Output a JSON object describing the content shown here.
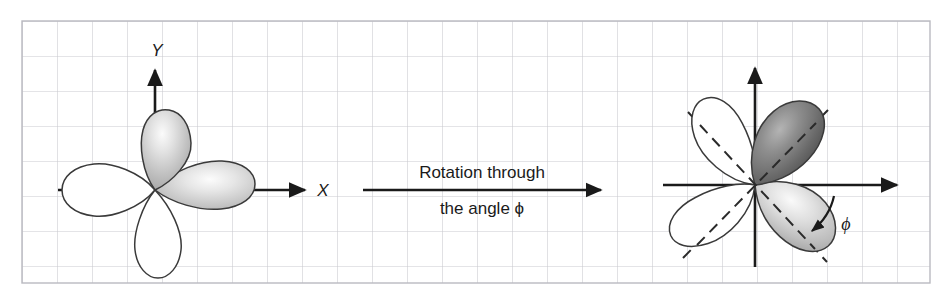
{
  "figure": {
    "background_color": "#ffffff",
    "grid": {
      "visible": true,
      "line_color": "#c9c9cf",
      "border_color": "#b9b9c0",
      "cell_size_px": 35,
      "x_start": 22,
      "y_start": 21,
      "x_end": 930,
      "y_end": 283
    },
    "axis_color": "#1a1a1a",
    "orbital_outline_color": "#3a3a3a"
  },
  "left_diagram": {
    "name": "unrotated-d-orbital",
    "center": {
      "x": 155,
      "y": 190
    },
    "x_axis_label": "X",
    "y_axis_label": "Y",
    "lobes": [
      {
        "name": "lobe-top",
        "angle_deg": 90,
        "fill": "shaded"
      },
      {
        "name": "lobe-right",
        "angle_deg": 0,
        "fill": "shaded"
      },
      {
        "name": "lobe-left",
        "angle_deg": 180,
        "fill": "white"
      },
      {
        "name": "lobe-bottom",
        "angle_deg": 270,
        "fill": "white"
      }
    ]
  },
  "center_caption": {
    "name": "rotation-caption",
    "line1": "Rotation through",
    "line2": "the angle ϕ",
    "arrow": {
      "from_x": 363,
      "to_x": 601,
      "y": 190
    }
  },
  "right_diagram": {
    "name": "rotated-d-orbital",
    "center": {
      "x": 755,
      "y": 185
    },
    "rotation_deg": 55,
    "angle_symbol": "ϕ",
    "dashed_axes": true,
    "dashed_color": "#2a2a2a",
    "lobes": [
      {
        "name": "lobe-upper-right",
        "angle_deg": 55,
        "fill": "dark-shaded"
      },
      {
        "name": "lobe-lower-right",
        "angle_deg": -35,
        "fill": "light-shaded"
      },
      {
        "name": "lobe-upper-left",
        "angle_deg": 145,
        "fill": "white"
      },
      {
        "name": "lobe-lower-left",
        "angle_deg": 235,
        "fill": "white"
      }
    ],
    "curved_arrow": {
      "name": "rotation-angle-arrow",
      "label": "ϕ",
      "label_x": 846,
      "label_y": 227
    }
  },
  "colors": {
    "grid_line": "#c9c9cf",
    "grid_border": "#b9b9c0",
    "ink": "#1a1a1a",
    "lobe_outline": "#3a3a3a",
    "shade_light": "#f2f2f2",
    "shade_mid": "#b8b8b8",
    "shade_dark": "#4f4f4f"
  }
}
